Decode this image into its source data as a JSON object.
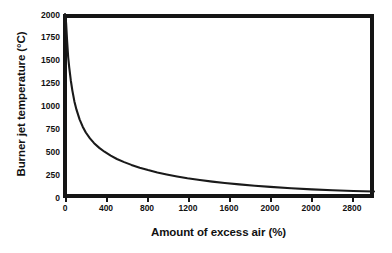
{
  "chart_data": {
    "type": "line",
    "title": "",
    "xlabel": "Amount of excess air (%)",
    "ylabel": "Burner jet temperature (°C)",
    "xlim": [
      0,
      3000
    ],
    "ylim": [
      0,
      2000
    ],
    "grid": false,
    "legend": false,
    "xticks": [
      0,
      400,
      800,
      1200,
      1600,
      2000,
      2000,
      2800
    ],
    "xtick_labels": [
      "0",
      "400",
      "800",
      "1200",
      "1600",
      "2000",
      "2000",
      "2800"
    ],
    "xtick_values": [
      0,
      400,
      800,
      1200,
      1600,
      2000,
      2400,
      2800
    ],
    "yticks": [
      0,
      250,
      500,
      750,
      1000,
      1250,
      1500,
      1750,
      2000
    ],
    "ytick_labels": [
      "0",
      "250",
      "500",
      "750",
      "1000",
      "1250",
      "1500",
      "1750",
      "2000"
    ],
    "series": [
      {
        "name": "Burner jet temperature",
        "color": "#1a1a1a",
        "x": [
          20,
          30,
          40,
          50,
          60,
          75,
          90,
          110,
          130,
          160,
          190,
          220,
          260,
          300,
          350,
          400,
          460,
          520,
          590,
          660,
          740,
          820,
          910,
          1000,
          1100,
          1200,
          1320,
          1440,
          1560,
          1700,
          1850,
          2000,
          2200,
          2400,
          2600,
          2800,
          3000
        ],
        "y": [
          2000,
          1900,
          1700,
          1530,
          1420,
          1280,
          1170,
          1050,
          960,
          855,
          775,
          712,
          648,
          596,
          545,
          503,
          460,
          424,
          390,
          360,
          330,
          304,
          278,
          256,
          234,
          214,
          195,
          178,
          163,
          148,
          133,
          121,
          106,
          94,
          84,
          76,
          70
        ]
      }
    ]
  },
  "axes": {
    "y_title": "Burner jet temperature (°C)",
    "x_title": "Amount of excess air (%)"
  }
}
